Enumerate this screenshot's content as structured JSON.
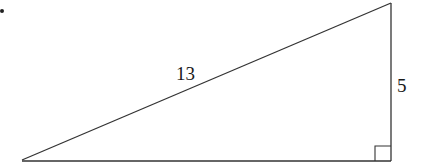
{
  "diagram": {
    "type": "right-triangle",
    "bullet": "•",
    "labels": {
      "hypotenuse": "13",
      "vertical_leg": "5"
    },
    "right_angle_marker": true,
    "stroke_color": "#333333"
  }
}
